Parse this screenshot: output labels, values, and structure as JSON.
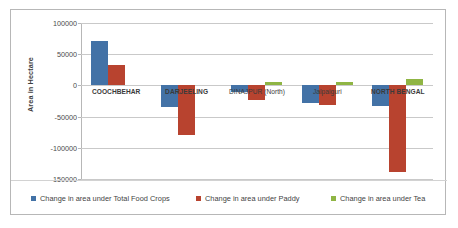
{
  "chart_data": {
    "type": "bar",
    "title": "",
    "xlabel": "",
    "ylabel": "Area in Hectare",
    "ylim": [
      -150000,
      100000
    ],
    "ytick_values": [
      100000,
      50000,
      0,
      -50000,
      -100000,
      -150000
    ],
    "ytick_labels": [
      "100000",
      "50000",
      "0",
      "-50000",
      "-100000",
      "-150000"
    ],
    "grid": true,
    "legend_position": "bottom",
    "categories": [
      "COOCHBEHAR",
      "DARJEELING",
      "DINAJPUR (North)",
      "Jalpaiguri",
      "NORTH BENGAL"
    ],
    "series": [
      {
        "name": "Change in area under Total Food Crops",
        "color": "#4372a6",
        "values": [
          71000,
          -35000,
          -10000,
          -28000,
          -33000
        ]
      },
      {
        "name": "Change in area under Paddy",
        "color": "#b8432f",
        "values": [
          33000,
          -80000,
          -24000,
          -31000,
          -139000
        ]
      },
      {
        "name": "Change in area under Tea",
        "color": "#8fb544",
        "values": [
          0,
          0,
          5000,
          6000,
          11000
        ]
      }
    ]
  },
  "legend": {
    "items": [
      {
        "label": "Change in area under Total Food Crops",
        "color": "#4372a6"
      },
      {
        "label": "Change in area under Paddy",
        "color": "#b8432f"
      },
      {
        "label": "Change in area under Tea",
        "color": "#8fb544"
      }
    ]
  },
  "axis": {
    "y_title": "Area in Hectare"
  }
}
